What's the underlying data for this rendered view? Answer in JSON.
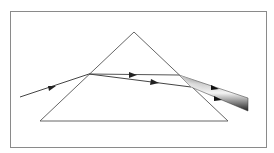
{
  "diagram": {
    "kind": "prism-dispersion",
    "width": 274,
    "height": 153,
    "colors": {
      "frame": "#8a8a8a",
      "prism": "#555555",
      "ray": "#444444",
      "beam_light": "#f2f2f2",
      "beam_dark": "#2a2a2a"
    },
    "frame": {
      "x": 10,
      "y": 11,
      "w": 256,
      "h": 136
    },
    "prism": {
      "apex": [
        134,
        32
      ],
      "base_left": [
        40,
        121
      ],
      "base_right": [
        228,
        121
      ]
    },
    "incident_ray": {
      "from": [
        20,
        97
      ],
      "to": [
        89,
        74
      ]
    },
    "internal_rays": [
      {
        "name": "upper",
        "from": [
          89,
          74
        ],
        "to": [
          179,
          75
        ]
      },
      {
        "name": "lower",
        "from": [
          89,
          74
        ],
        "to": [
          191,
          87
        ]
      }
    ],
    "output_beam": {
      "top_start": [
        179,
        75
      ],
      "bottom_start": [
        191,
        87
      ],
      "top_end": [
        248,
        98
      ],
      "bottom_end": [
        248,
        111
      ]
    }
  }
}
